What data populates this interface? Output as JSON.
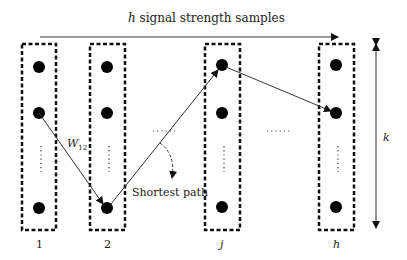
{
  "title": {
    "prefix": "h",
    "text": " signal strength samples"
  },
  "edge_label": {
    "main": "W",
    "sub": "12"
  },
  "annotation": "Shortest path",
  "columns": [
    {
      "label": "1"
    },
    {
      "label": "2"
    },
    {
      "label": "j"
    },
    {
      "label": "h"
    }
  ],
  "k_label": "k",
  "ellipsis_between": "……",
  "colors": {
    "line": "#333333",
    "dot": "#000000"
  }
}
